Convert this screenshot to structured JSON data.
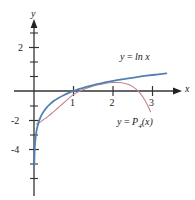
{
  "figure": {
    "type": "math-graph",
    "background": "#ffffff",
    "axis_color": "#333333",
    "text_color": "#1a1a1a",
    "axis_labels": {
      "x": "x",
      "y": "y"
    },
    "curve_labels": {
      "ln": "y = ln x",
      "ln_lhs": "y",
      "ln_eq": "=",
      "ln_rhs": "ln x",
      "poly_lhs": "y",
      "poly_eq": "=",
      "poly_rhs_base": "P",
      "poly_rhs_sub": "4",
      "poly_rhs_arg": "(x)",
      "poly": "y = P4(x)"
    }
  },
  "chart_data": {
    "type": "line",
    "title": "",
    "xlabel": "x",
    "ylabel": "y",
    "xlim": [
      -0.1,
      3.45
    ],
    "ylim": [
      -5.2,
      2.6
    ],
    "grid": false,
    "legend": "inline-annotations",
    "xticks": [
      1,
      2,
      3
    ],
    "xtick_labels": [
      "1",
      "2",
      "3"
    ],
    "yticks": [
      -4,
      -2,
      2
    ],
    "ytick_labels": [
      "-4",
      "-2",
      "2"
    ],
    "ytick_minor": [
      -5,
      -3,
      -1,
      1
    ],
    "series": [
      {
        "name": "y = ln x",
        "color": "#5180b4",
        "width": 1.8,
        "x": [
          0.006,
          0.009,
          0.013,
          0.018,
          0.025,
          0.035,
          0.05,
          0.07,
          0.09,
          0.12,
          0.15,
          0.2,
          0.25,
          0.32,
          0.4,
          0.5,
          0.62,
          0.75,
          0.88,
          1.0,
          1.15,
          1.3,
          1.5,
          1.7,
          1.9,
          2.1,
          2.35,
          2.6,
          2.85,
          3.1,
          3.35
        ],
        "y": [
          -5.12,
          -4.71,
          -4.34,
          -4.02,
          -3.69,
          -3.35,
          -3.0,
          -2.66,
          -2.41,
          -2.12,
          -1.9,
          -1.61,
          -1.39,
          -1.14,
          -0.92,
          -0.69,
          -0.48,
          -0.29,
          -0.13,
          0.0,
          0.14,
          0.26,
          0.41,
          0.53,
          0.64,
          0.74,
          0.85,
          0.96,
          1.05,
          1.13,
          1.21
        ]
      },
      {
        "name": "y = P4(x)",
        "color": "#c08690",
        "width": 1.1,
        "x": [
          0.06,
          0.1,
          0.15,
          0.2,
          0.28,
          0.36,
          0.45,
          0.55,
          0.65,
          0.78,
          0.9,
          1.0,
          1.15,
          1.3,
          1.45,
          1.6,
          1.8,
          2.0,
          2.15,
          2.3,
          2.4,
          2.5,
          2.6,
          2.7,
          2.8,
          2.9,
          2.95
        ],
        "y": [
          -2.27,
          -2.23,
          -2.15,
          -2.05,
          -1.9,
          -1.73,
          -1.53,
          -1.3,
          -1.06,
          -0.75,
          -0.46,
          -0.25,
          -0.02,
          0.16,
          0.3,
          0.41,
          0.52,
          0.58,
          0.58,
          0.52,
          0.44,
          0.3,
          0.09,
          -0.2,
          -0.6,
          -1.12,
          -1.42
        ]
      }
    ],
    "annotations": [
      {
        "text": "y = ln x",
        "x": 2.25,
        "y": 1.55,
        "color": "#1a1a1a"
      },
      {
        "text": "y = P4(x)",
        "x": 2.15,
        "y": -1.45,
        "color": "#1a1a1a"
      }
    ]
  }
}
